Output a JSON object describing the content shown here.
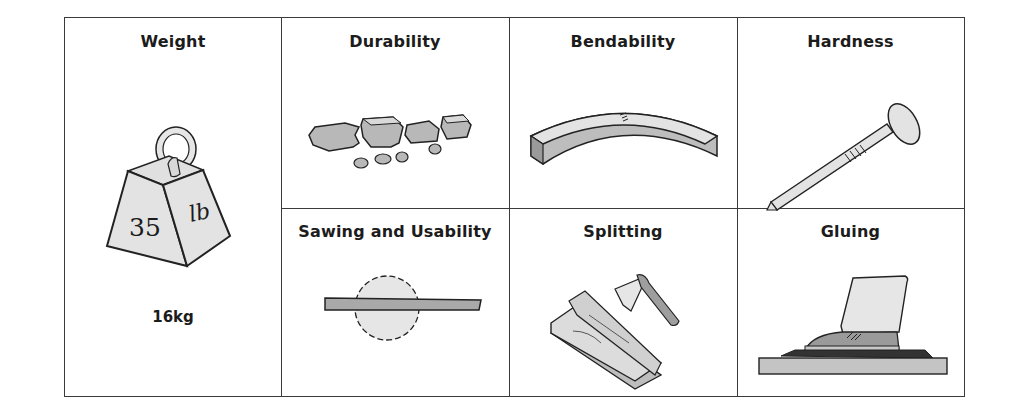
{
  "figure": {
    "cells": [
      {
        "id": "weight",
        "title": "Weight",
        "icon": "weight-icon",
        "weight_number": "35",
        "weight_unit": "lb",
        "caption": "16kg"
      },
      {
        "id": "durability",
        "title": "Durability",
        "icon": "broken-pieces-icon"
      },
      {
        "id": "bendability",
        "title": "Bendability",
        "icon": "bent-beam-icon"
      },
      {
        "id": "hardness",
        "title": "Hardness",
        "icon": "nail-icon"
      },
      {
        "id": "sawing",
        "title": "Sawing and Usability",
        "icon": "circular-saw-icon"
      },
      {
        "id": "splitting",
        "title": "Splitting",
        "icon": "axe-and-log-icon"
      },
      {
        "id": "gluing",
        "title": "Gluing",
        "icon": "clamped-shoe-icon"
      }
    ],
    "colors": {
      "border": "#3a3a3a",
      "fill_light": "#e6e6e6",
      "fill_mid": "#bdbdbd",
      "fill_dark": "#8f8f8f",
      "text": "#1c1c1c"
    }
  }
}
